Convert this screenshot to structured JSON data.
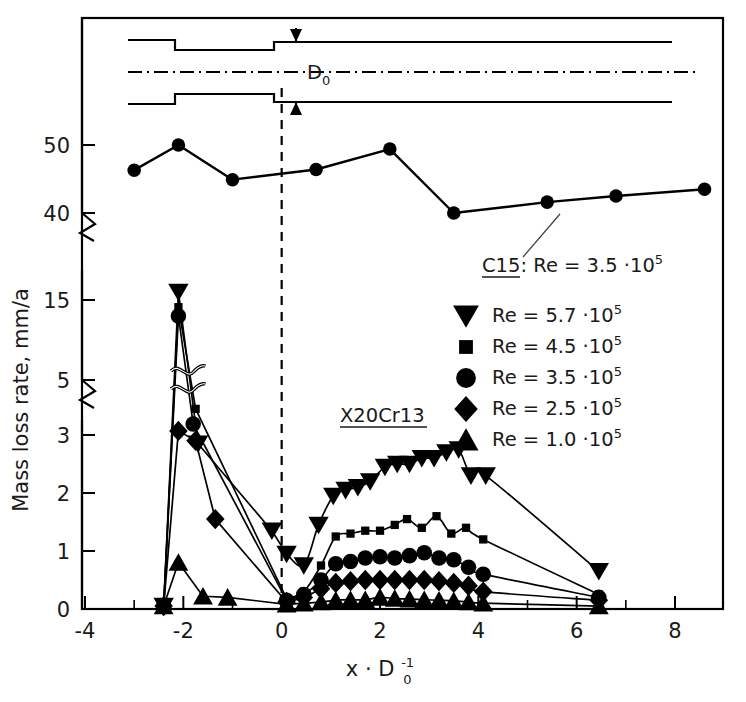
{
  "figure": {
    "title": "",
    "width": 746,
    "height": 702
  },
  "axes": {
    "xlabel": "x · D",
    "xlabel_sub": "0",
    "xlabel_sup": "-1",
    "ylabel": "Mass loss rate, mm/a",
    "x_ticks": [
      "-4",
      "-2",
      "0",
      "2",
      "4",
      "6",
      "8"
    ],
    "x_tick_values": [
      -4,
      -2,
      0,
      2,
      4,
      6,
      8
    ],
    "x_minor_values": [
      -3,
      -1,
      1,
      3,
      5,
      7
    ],
    "y_ticks": [
      "0",
      "1",
      "2",
      "3",
      "5",
      "15",
      "40",
      "50"
    ],
    "y_tick_values": [
      0,
      1,
      2,
      3,
      5,
      15,
      40,
      50
    ],
    "xlim": [
      -4.6,
      9.1
    ],
    "ylim_segments": [
      [
        0,
        3
      ],
      [
        5,
        15
      ],
      [
        40,
        50
      ]
    ],
    "broken_axis": true,
    "grid": false
  },
  "diagram": {
    "name": "sudden-expansion-pipe-schematic",
    "dimension_label": "D",
    "dimension_label_sub": "0"
  },
  "annotations": {
    "c15_label": "C15:",
    "c15_re": "Re = 3.5 ·10",
    "c15_re_exp": "5",
    "material_label": "X20Cr13"
  },
  "legend": {
    "position": "right-middle",
    "items": [
      {
        "marker": "triangle-down",
        "label": "Re = 5.7 ·10",
        "exp": "5"
      },
      {
        "marker": "square",
        "label": "Re = 4.5 ·10",
        "exp": "5"
      },
      {
        "marker": "circle",
        "label": "Re = 3.5 ·10",
        "exp": "5"
      },
      {
        "marker": "diamond",
        "label": "Re = 2.5 ·10",
        "exp": "5"
      },
      {
        "marker": "triangle-up",
        "label": "Re = 1.0 ·10",
        "exp": "5"
      }
    ]
  },
  "chart_data": {
    "type": "line",
    "xlabel": "x · D0^-1",
    "ylabel": "Mass loss rate, mm/a",
    "xlim": [
      -4.6,
      9.1
    ],
    "ylim": [
      0,
      52
    ],
    "grid": false,
    "legend_position": "right-middle",
    "broken_y_axis_segments": [
      [
        0,
        3
      ],
      [
        5,
        15
      ],
      [
        40,
        50
      ]
    ],
    "series": [
      {
        "name": "C15: Re = 3.5 ·10^5",
        "material": "C15",
        "reynolds": "3.5e5",
        "marker": "circle",
        "x": [
          -3.0,
          -2.1,
          -1.0,
          0.7,
          2.2,
          3.5,
          5.4,
          6.8,
          8.6
        ],
        "y": [
          46.3,
          51.0,
          44.9,
          46.4,
          49.4,
          40.0,
          41.6,
          42.5,
          43.5
        ]
      },
      {
        "name": "X20Cr13: Re = 5.7 ·10^5",
        "material": "X20Cr13",
        "reynolds": "5.7e5",
        "marker": "triangle-down",
        "x": [
          -2.4,
          -2.1,
          -1.7,
          -0.2,
          0.1,
          0.45,
          0.75,
          1.05,
          1.3,
          1.55,
          1.8,
          2.1,
          2.35,
          2.6,
          2.85,
          3.1,
          3.35,
          3.6,
          3.85,
          4.15,
          6.45
        ],
        "y": [
          0.05,
          17.3,
          2.85,
          1.35,
          0.95,
          0.75,
          1.45,
          1.95,
          2.05,
          2.1,
          2.2,
          2.45,
          2.5,
          2.5,
          2.6,
          2.6,
          2.7,
          2.75,
          2.3,
          2.3,
          0.65
        ]
      },
      {
        "name": "X20Cr13: Re = 4.5 ·10^5",
        "material": "X20Cr13",
        "reynolds": "4.5e5",
        "marker": "square",
        "x": [
          -2.4,
          -2.1,
          -1.75,
          0.1,
          0.45,
          0.8,
          1.1,
          1.4,
          1.7,
          2.0,
          2.3,
          2.55,
          2.85,
          3.15,
          3.45,
          3.75,
          4.1,
          6.45
        ],
        "y": [
          0.05,
          14.1,
          3.95,
          0.18,
          0.3,
          0.75,
          1.25,
          1.3,
          1.35,
          1.35,
          1.45,
          1.55,
          1.4,
          1.6,
          1.3,
          1.4,
          1.2,
          0.25
        ]
      },
      {
        "name": "X20Cr13: Re = 3.5 ·10^5",
        "material": "X20Cr13",
        "reynolds": "3.5e5",
        "marker": "circle",
        "x": [
          -2.4,
          -2.1,
          -1.8,
          0.1,
          0.45,
          0.8,
          1.1,
          1.4,
          1.7,
          2.0,
          2.3,
          2.6,
          2.9,
          3.2,
          3.5,
          3.8,
          4.1,
          6.45
        ],
        "y": [
          0.05,
          13.0,
          3.4,
          0.15,
          0.25,
          0.5,
          0.78,
          0.82,
          0.88,
          0.9,
          0.88,
          0.92,
          0.97,
          0.88,
          0.85,
          0.72,
          0.6,
          0.2
        ]
      },
      {
        "name": "X20Cr13: Re = 2.5 ·10^5",
        "material": "X20Cr13",
        "reynolds": "2.5e5",
        "marker": "diamond",
        "x": [
          -2.4,
          -2.1,
          -1.75,
          -1.35,
          0.1,
          0.45,
          0.8,
          1.1,
          1.4,
          1.7,
          2.0,
          2.3,
          2.6,
          2.9,
          3.2,
          3.5,
          3.8,
          4.1,
          6.45
        ],
        "y": [
          0.05,
          3.15,
          2.9,
          1.55,
          0.12,
          0.2,
          0.35,
          0.45,
          0.48,
          0.5,
          0.5,
          0.5,
          0.5,
          0.5,
          0.48,
          0.45,
          0.4,
          0.3,
          0.15
        ]
      },
      {
        "name": "X20Cr13: Re = 1.0 ·10^5",
        "material": "X20Cr13",
        "reynolds": "1.0e5",
        "marker": "triangle-up",
        "x": [
          -2.4,
          -2.1,
          -1.6,
          -1.1,
          0.1,
          0.45,
          0.8,
          1.1,
          1.4,
          1.7,
          2.0,
          2.3,
          2.6,
          2.9,
          3.2,
          3.5,
          3.8,
          4.1,
          6.45
        ],
        "y": [
          0.05,
          0.8,
          0.22,
          0.2,
          0.08,
          0.1,
          0.12,
          0.15,
          0.16,
          0.16,
          0.2,
          0.18,
          0.17,
          0.16,
          0.15,
          0.14,
          0.12,
          0.1,
          0.05
        ]
      }
    ]
  }
}
